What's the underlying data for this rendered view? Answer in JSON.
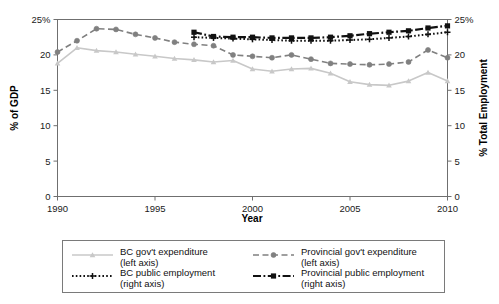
{
  "chart_data": {
    "type": "line",
    "title": "",
    "xlabel": "Year",
    "ylabel": "% of GDP",
    "y2label": "% Total Employment",
    "xlim": [
      1990,
      2010
    ],
    "ylim": [
      0,
      25
    ],
    "y2lim": [
      0,
      25
    ],
    "grid": false,
    "legend_position": "bottom",
    "xticks": [
      1990,
      1995,
      2000,
      2005,
      2010
    ],
    "xtick_labels": [
      "1990",
      "1995",
      "2000",
      "2005",
      "2010"
    ],
    "yticks": [
      0,
      5,
      10,
      15,
      20,
      25
    ],
    "ytick_labels": [
      "0",
      "5",
      "10",
      "15",
      "20",
      "25%"
    ],
    "y2ticks": [
      0,
      5,
      10,
      15,
      20,
      25
    ],
    "y2tick_labels": [
      "0",
      "5",
      "10",
      "15",
      "20",
      "25%"
    ],
    "series": [
      {
        "name": "BC gov't expenditure",
        "axis": "left",
        "color": "#c8c8c8",
        "dash": "none",
        "marker": "triangle",
        "x": [
          1990,
          1991,
          1992,
          1993,
          1994,
          1995,
          1996,
          1997,
          1998,
          1999,
          2000,
          2001,
          2002,
          2003,
          2004,
          2005,
          2006,
          2007,
          2008,
          2009,
          2010
        ],
        "values": [
          18.8,
          21.0,
          20.6,
          20.4,
          20.1,
          19.8,
          19.5,
          19.3,
          19.0,
          19.2,
          18.0,
          17.7,
          18.0,
          18.1,
          17.4,
          16.2,
          15.8,
          15.7,
          16.3,
          17.5,
          16.3
        ]
      },
      {
        "name": "Provincial gov't expenditure",
        "axis": "left",
        "color": "#808080",
        "dash": "dashed",
        "marker": "circle",
        "x": [
          1990,
          1991,
          1992,
          1993,
          1994,
          1995,
          1996,
          1997,
          1998,
          1999,
          2000,
          2001,
          2002,
          2003,
          2004,
          2005,
          2006,
          2007,
          2008,
          2009,
          2010
        ],
        "values": [
          20.4,
          22.0,
          23.7,
          23.6,
          22.9,
          22.4,
          21.8,
          21.5,
          21.3,
          20.0,
          19.8,
          19.6,
          20.0,
          19.4,
          18.8,
          18.7,
          18.6,
          18.7,
          19.0,
          20.7,
          19.6
        ]
      },
      {
        "name": "BC public employment",
        "axis": "right",
        "color": "#111111",
        "dash": "dotted",
        "marker": "plus",
        "x": [
          1997,
          1998,
          1999,
          2000,
          2001,
          2002,
          2003,
          2004,
          2005,
          2006,
          2007,
          2008,
          2009,
          2010
        ],
        "values": [
          22.5,
          22.4,
          22.3,
          22.2,
          22.1,
          22.0,
          22.0,
          22.0,
          22.1,
          22.2,
          22.4,
          22.6,
          22.9,
          23.2
        ]
      },
      {
        "name": "Provincial public employment",
        "axis": "right",
        "color": "#111111",
        "dash": "dashdot",
        "marker": "square",
        "x": [
          1997,
          1998,
          1999,
          2000,
          2001,
          2002,
          2003,
          2004,
          2005,
          2006,
          2007,
          2008,
          2009,
          2010
        ],
        "values": [
          23.2,
          22.6,
          22.5,
          22.5,
          22.4,
          22.4,
          22.4,
          22.5,
          22.7,
          23.0,
          23.2,
          23.4,
          23.8,
          24.1
        ]
      }
    ]
  },
  "axes": {
    "x_title": "Year",
    "y_left_title": "% of GDP",
    "y_right_title": "% Total Employment"
  },
  "legend": {
    "entries": [
      {
        "label_line1": "BC gov't expenditure",
        "label_line2": "(left axis)"
      },
      {
        "label_line1": "Provincial gov't expenditure",
        "label_line2": "(left axis)"
      },
      {
        "label_line1": "BC public employment",
        "label_line2": "(right axis)"
      },
      {
        "label_line1": "Provincial public employment",
        "label_line2": "(right axis)"
      }
    ]
  },
  "colors": {
    "bc_expenditure": "#c8c8c8",
    "provincial_expenditure": "#808080",
    "employment": "#111111",
    "frame": "#6f6f6f"
  }
}
